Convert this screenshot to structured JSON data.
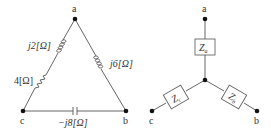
{
  "delta": {
    "nodes": {
      "a": "a",
      "b": "b",
      "c": "c"
    },
    "branches": {
      "ca_inductor": "j2[Ω]",
      "ca_resistor": "4[Ω]",
      "ab_inductor": "j6[Ω]",
      "cb_capacitor": "−j8[Ω]"
    }
  },
  "wye": {
    "nodes": {
      "a": "a",
      "b": "b",
      "c": "c"
    },
    "impedances": {
      "za": "Z",
      "za_sub": "a",
      "zb": "Z",
      "zb_sub": "b",
      "zc": "Z",
      "zc_sub": "c"
    }
  },
  "colors": {
    "wire": "#555555",
    "node": "#111111",
    "text": "#333333"
  }
}
